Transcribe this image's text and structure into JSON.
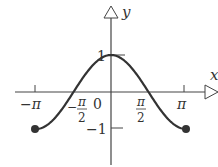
{
  "figure": {
    "type": "function-graph",
    "function": "y = cos x",
    "domain": [
      -3.14159,
      3.14159
    ],
    "axes": {
      "x_label": "x",
      "y_label": "y"
    },
    "x_ticks": [
      {
        "value": -3.14159,
        "label": "−π"
      },
      {
        "value": -1.5708,
        "label_num": "π",
        "label_den": "2",
        "sign": "−"
      },
      {
        "value": 0,
        "label": "0"
      },
      {
        "value": 1.5708,
        "label_num": "π",
        "label_den": "2"
      },
      {
        "value": 3.14159,
        "label": "π"
      }
    ],
    "y_ticks": [
      {
        "value": 1,
        "label": "1"
      },
      {
        "value": -1,
        "label": "−1"
      }
    ],
    "endpoints": [
      {
        "x": -3.14159,
        "y": -1,
        "style": "closed-dot"
      },
      {
        "x": 3.14159,
        "y": -1,
        "style": "closed-dot"
      }
    ],
    "colors": {
      "curve": "#333333",
      "axes": "#444444"
    }
  }
}
